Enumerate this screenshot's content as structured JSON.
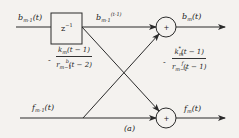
{
  "diagram": {
    "type": "lattice-filter-stage",
    "caption": "(a)",
    "nodes": {
      "delay": {
        "label": "z⁻¹"
      },
      "sum_top": {
        "label": "+"
      },
      "sum_bottom": {
        "label": "+"
      }
    },
    "signals": {
      "b_in": {
        "base": "b",
        "sub": "m-1",
        "arg": "(t)"
      },
      "b_delayed": {
        "base": "b",
        "sub": "m-1",
        "sup": "(t-1)"
      },
      "b_out": {
        "base": "b",
        "sub": "m",
        "arg": "(t)"
      },
      "f_in": {
        "base": "f",
        "sub": "m-1",
        "arg": "(t)"
      },
      "f_out": {
        "base": "f",
        "sub": "m",
        "arg": "(t)"
      }
    },
    "gains": {
      "left": {
        "sign": "-",
        "numerator": "k_m(t-1)",
        "denominator": "r^b_{m-1}(t-2)"
      },
      "right": {
        "sign": "-",
        "numerator": "k*_m(t-1)",
        "denominator": "r^f_{m-1}(t-1)"
      }
    },
    "colors": {
      "line": "#2a2a2a",
      "background": "#f4f2ef"
    }
  }
}
